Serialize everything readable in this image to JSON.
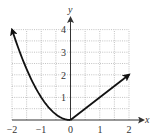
{
  "chart_data": {
    "type": "line",
    "title": "",
    "xlabel": "x",
    "ylabel": "y",
    "xlim": [
      -2,
      2
    ],
    "ylim": [
      0,
      4
    ],
    "grid": true,
    "grid_step": 0.5,
    "x_ticks": [
      "-2",
      "-1",
      "0",
      "1",
      "2"
    ],
    "y_ticks": [
      "1",
      "2",
      "3",
      "4"
    ],
    "series": [
      {
        "name": "y = x^2 (x <= 0)",
        "x": [
          -2,
          -1.5,
          -1,
          -0.5,
          0
        ],
        "y": [
          4,
          2.25,
          1,
          0.25,
          0
        ],
        "end_arrow": "left"
      },
      {
        "name": "y = x (x >= 0)",
        "x": [
          0,
          1,
          2
        ],
        "y": [
          0,
          1,
          2
        ],
        "end_arrow": "right"
      }
    ]
  },
  "labels": {
    "x_axis": "x",
    "y_axis": "y",
    "x_ticks": [
      "−2",
      "−1",
      "0",
      "1",
      "2"
    ],
    "y_ticks": [
      "1",
      "2",
      "3",
      "4"
    ]
  },
  "colors": {
    "curve": "#111111",
    "grid": "#9a9a9a",
    "axis": "#333333"
  }
}
